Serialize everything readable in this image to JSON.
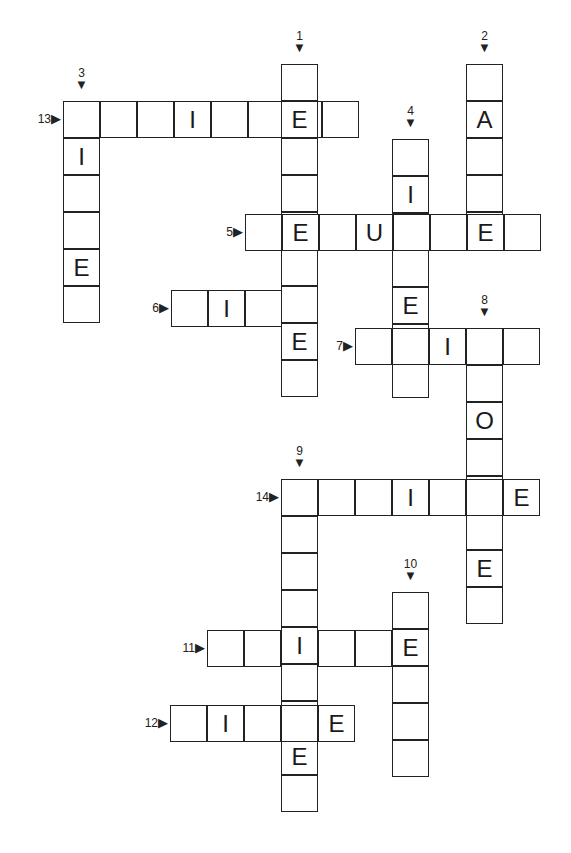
{
  "puzzle": {
    "type": "crossword",
    "cell_size": 37,
    "entries": [
      {
        "number": "13",
        "direction": "across",
        "x": 63,
        "y": 101,
        "length": 8,
        "letters": [
          "",
          "",
          "",
          "I",
          "",
          "",
          "E",
          ""
        ]
      },
      {
        "number": "3",
        "direction": "down",
        "x": 63,
        "y": 101,
        "length": 6,
        "letters": [
          "",
          "I",
          "",
          "",
          "E",
          ""
        ]
      },
      {
        "number": "1",
        "direction": "down",
        "x": 281,
        "y": 64,
        "length": 9,
        "letters": [
          "",
          "E",
          "",
          "",
          "E",
          "",
          "",
          "E",
          ""
        ]
      },
      {
        "number": "2",
        "direction": "down",
        "x": 466,
        "y": 64,
        "length": 5,
        "letters": [
          "",
          "A",
          "",
          "",
          "E"
        ]
      },
      {
        "number": "4",
        "direction": "down",
        "x": 392,
        "y": 139,
        "length": 7,
        "letters": [
          "",
          "I",
          "",
          "",
          "E",
          "",
          ""
        ]
      },
      {
        "number": "5",
        "direction": "across",
        "x": 245,
        "y": 214,
        "length": 8,
        "letters": [
          "",
          "E",
          "",
          "U",
          "",
          "",
          "E",
          ""
        ]
      },
      {
        "number": "6",
        "direction": "across",
        "x": 171,
        "y": 290,
        "length": 4,
        "letters": [
          "",
          "I",
          "",
          ""
        ]
      },
      {
        "number": "7",
        "direction": "across",
        "x": 355,
        "y": 328,
        "length": 5,
        "letters": [
          "",
          "",
          "I",
          "",
          ""
        ]
      },
      {
        "number": "8",
        "direction": "down",
        "x": 466,
        "y": 328,
        "length": 8,
        "letters": [
          "",
          "",
          "O",
          "",
          "",
          "",
          "E",
          ""
        ]
      },
      {
        "number": "14",
        "direction": "across",
        "x": 281,
        "y": 479,
        "length": 7,
        "letters": [
          "",
          "",
          "",
          "I",
          "",
          "",
          "E"
        ]
      },
      {
        "number": "9",
        "direction": "down",
        "x": 281,
        "y": 479,
        "length": 9,
        "letters": [
          "",
          "",
          "",
          "",
          "I",
          "",
          "",
          "E",
          ""
        ]
      },
      {
        "number": "10",
        "direction": "down",
        "x": 392,
        "y": 592,
        "length": 5,
        "letters": [
          "",
          "E",
          "",
          "",
          ""
        ]
      },
      {
        "number": "11",
        "direction": "across",
        "x": 207,
        "y": 630,
        "length": 6,
        "letters": [
          "",
          "",
          "I",
          "",
          "",
          "E"
        ]
      },
      {
        "number": "12",
        "direction": "across",
        "x": 170,
        "y": 705,
        "length": 5,
        "letters": [
          "",
          "I",
          "",
          "",
          "E"
        ]
      }
    ],
    "arrows": {
      "down": "▼",
      "across": "▶"
    }
  }
}
